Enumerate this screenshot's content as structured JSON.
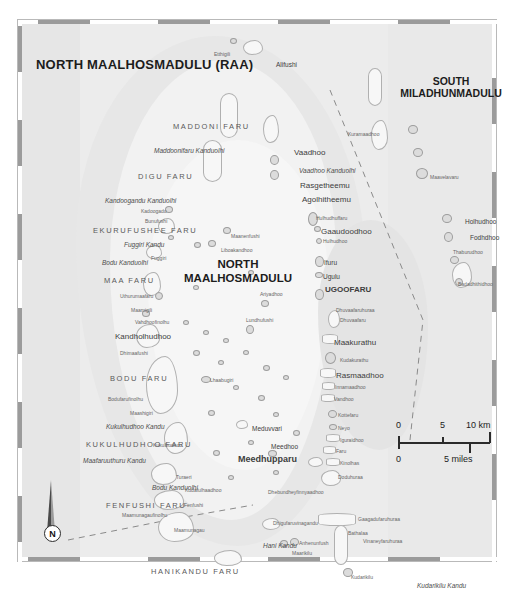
{
  "map": {
    "atoll_title": "NORTH MAALHOSMADULU (RAA)",
    "center_label_line1": "NORTH",
    "center_label_line2": "MAALHOSMADULU",
    "neighbour_line1": "SOUTH",
    "neighbour_line2": "MILADHUNMADULU",
    "capital": "Meedhupparu",
    "capital_marker": "UGOOFARU",
    "north_letter": "N"
  },
  "scale": {
    "km_zero": "0",
    "km_mid": "5",
    "km_max": "10 km",
    "mi_zero": "0",
    "mi_max": "5 miles"
  },
  "reefs": [
    {
      "name": "MADDONI FARU",
      "x": 155,
      "y": 103
    },
    {
      "name": "DIGU FARU",
      "x": 120,
      "y": 153
    },
    {
      "name": "EKURUFUSHEE FARU",
      "x": 75,
      "y": 207
    },
    {
      "name": "MAA FARU",
      "x": 86,
      "y": 257
    },
    {
      "name": "BODU FARU",
      "x": 92,
      "y": 355
    },
    {
      "name": "KUKULHUDHOO FARU",
      "x": 68,
      "y": 421
    },
    {
      "name": "FENFUSHI FARU",
      "x": 88,
      "y": 482
    },
    {
      "name": "HANIKANDU FARU",
      "x": 133,
      "y": 548
    }
  ],
  "channels": [
    {
      "name": "Maddoonifaru Kanduolhi",
      "x": 136,
      "y": 128
    },
    {
      "name": "Kandoogandu Kanduolhi",
      "x": 87,
      "y": 178
    },
    {
      "name": "Fuggiri Kandu",
      "x": 106,
      "y": 222
    },
    {
      "name": "Bodu Kanduolhi",
      "x": 84,
      "y": 240
    },
    {
      "name": "Vaadhoo Kanduolhi",
      "x": 281,
      "y": 148
    },
    {
      "name": "Kukulhudhoo Kandu",
      "x": 88,
      "y": 404
    },
    {
      "name": "Maafaruuthuru Kandu",
      "x": 65,
      "y": 438
    },
    {
      "name": "Bodu Kanduolhi",
      "x": 134,
      "y": 465
    },
    {
      "name": "Hani Kandu",
      "x": 245,
      "y": 523
    },
    {
      "name": "Kudarikilu Kandu",
      "x": 399,
      "y": 563
    }
  ],
  "islands": [
    {
      "name": "Etthigili",
      "x": 196,
      "y": 32,
      "cls": "tiny"
    },
    {
      "name": "Alifushi",
      "x": 258,
      "y": 42,
      "cls": "isl"
    },
    {
      "name": "Kuramaadhoo",
      "x": 330,
      "y": 112,
      "cls": "tiny"
    },
    {
      "name": "Vaadhoo",
      "x": 276,
      "y": 129,
      "cls": "isl big"
    },
    {
      "name": "Rasgetheemu",
      "x": 282,
      "y": 162,
      "cls": "isl big"
    },
    {
      "name": "Agolhitheemu",
      "x": 284,
      "y": 176,
      "cls": "isl big"
    },
    {
      "name": "Maavelavaru",
      "x": 412,
      "y": 155,
      "cls": "tiny"
    },
    {
      "name": "Kadoogadu",
      "x": 123,
      "y": 189,
      "cls": "tiny"
    },
    {
      "name": "Bunufushi",
      "x": 127,
      "y": 199,
      "cls": "tiny"
    },
    {
      "name": "Hulhudhuffaru",
      "x": 298,
      "y": 196,
      "cls": "tiny"
    },
    {
      "name": "Gaaudoodhoo",
      "x": 303,
      "y": 208,
      "cls": "isl big"
    },
    {
      "name": "Hulhudhoo",
      "x": 305,
      "y": 219,
      "cls": "tiny"
    },
    {
      "name": "Holhudhoo",
      "x": 447,
      "y": 199,
      "cls": "isl"
    },
    {
      "name": "Fodhdhoo",
      "x": 452,
      "y": 215,
      "cls": "isl"
    },
    {
      "name": "Thaburudhoo",
      "x": 435,
      "y": 230,
      "cls": "tiny"
    },
    {
      "name": "Maanenfushi",
      "x": 213,
      "y": 214,
      "cls": "tiny"
    },
    {
      "name": "Liboakandhoo",
      "x": 203,
      "y": 228,
      "cls": "tiny"
    },
    {
      "name": "Fuggiri",
      "x": 133,
      "y": 236,
      "cls": "tiny"
    },
    {
      "name": "Ifuru",
      "x": 306,
      "y": 240,
      "cls": "isl"
    },
    {
      "name": "Ugulu",
      "x": 305,
      "y": 254,
      "cls": "isl"
    },
    {
      "name": "Badadhithidhoo",
      "x": 440,
      "y": 262,
      "cls": "tiny"
    },
    {
      "name": "Uthurumaafaru",
      "x": 102,
      "y": 274,
      "cls": "tiny"
    },
    {
      "name": "Ariyadhoo",
      "x": 242,
      "y": 272,
      "cls": "tiny"
    },
    {
      "name": "Maamigili",
      "x": 113,
      "y": 288,
      "cls": "tiny"
    },
    {
      "name": "Dhuvaafaruhuraa",
      "x": 318,
      "y": 288,
      "cls": "tiny"
    },
    {
      "name": "Dhuvaafaru",
      "x": 322,
      "y": 298,
      "cls": "tiny"
    },
    {
      "name": "Lundhufushi",
      "x": 228,
      "y": 298,
      "cls": "tiny"
    },
    {
      "name": "Vahdhoofinolhu",
      "x": 117,
      "y": 300,
      "cls": "tiny"
    },
    {
      "name": "Kandholhudhoo",
      "x": 97,
      "y": 313,
      "cls": "isl big"
    },
    {
      "name": "Maakurathu",
      "x": 316,
      "y": 319,
      "cls": "isl big"
    },
    {
      "name": "Dhimaafushi",
      "x": 102,
      "y": 331,
      "cls": "tiny"
    },
    {
      "name": "Kudakurathu",
      "x": 322,
      "y": 338,
      "cls": "tiny"
    },
    {
      "name": "Rasmaadhoo",
      "x": 318,
      "y": 352,
      "cls": "isl big"
    },
    {
      "name": "Innamaadhoo",
      "x": 317,
      "y": 365,
      "cls": "tiny"
    },
    {
      "name": "Lhaabugiri",
      "x": 192,
      "y": 358,
      "cls": "tiny"
    },
    {
      "name": "Vandhoo",
      "x": 316,
      "y": 377,
      "cls": "tiny"
    },
    {
      "name": "Bodufarufinolhu",
      "x": 90,
      "y": 377,
      "cls": "tiny"
    },
    {
      "name": "Maashigiri",
      "x": 112,
      "y": 391,
      "cls": "tiny"
    },
    {
      "name": "Kottefaru",
      "x": 320,
      "y": 393,
      "cls": "tiny"
    },
    {
      "name": "Meduvvari",
      "x": 234,
      "y": 406,
      "cls": "isl"
    },
    {
      "name": "Neyo",
      "x": 320,
      "y": 406,
      "cls": "tiny"
    },
    {
      "name": "Iguraidhoo",
      "x": 322,
      "y": 418,
      "cls": "tiny"
    },
    {
      "name": "Kukulhudhoo",
      "x": 135,
      "y": 423,
      "cls": "tiny"
    },
    {
      "name": "Meedhoo",
      "x": 253,
      "y": 424,
      "cls": "isl"
    },
    {
      "name": "Faru",
      "x": 318,
      "y": 429,
      "cls": "tiny"
    },
    {
      "name": "Kinolhas",
      "x": 322,
      "y": 441,
      "cls": "tiny"
    },
    {
      "name": "Turaeri",
      "x": 158,
      "y": 455,
      "cls": "tiny"
    },
    {
      "name": "Doduhuraa",
      "x": 320,
      "y": 455,
      "cls": "tiny"
    },
    {
      "name": "Kudafulhaadhoo",
      "x": 167,
      "y": 468,
      "cls": "tiny"
    },
    {
      "name": "Dhebundheyfinnyaadhoo",
      "x": 250,
      "y": 470,
      "cls": "tiny"
    },
    {
      "name": "Fenfushi",
      "x": 166,
      "y": 483,
      "cls": "tiny"
    },
    {
      "name": "Maamunagaufinolhu",
      "x": 104,
      "y": 493,
      "cls": "tiny"
    },
    {
      "name": "Dhigufaruvinagandu",
      "x": 255,
      "y": 501,
      "cls": "tiny"
    },
    {
      "name": "Gaagadufaruhuraa",
      "x": 340,
      "y": 497,
      "cls": "tiny"
    },
    {
      "name": "Maamunagau",
      "x": 156,
      "y": 508,
      "cls": "tiny"
    },
    {
      "name": "Bathalaa",
      "x": 330,
      "y": 511,
      "cls": "tiny"
    },
    {
      "name": "Vinaneyfaruhuraa",
      "x": 345,
      "y": 519,
      "cls": "tiny"
    },
    {
      "name": "Anhenunfush",
      "x": 281,
      "y": 521,
      "cls": "tiny"
    },
    {
      "name": "Maarikilu",
      "x": 274,
      "y": 531,
      "cls": "tiny"
    },
    {
      "name": "Kudarikilu",
      "x": 333,
      "y": 555,
      "cls": "tiny"
    }
  ]
}
